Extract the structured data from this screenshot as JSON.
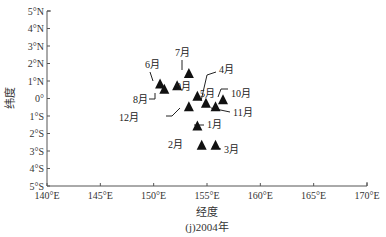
{
  "chart_data": {
    "type": "scatter",
    "title": "",
    "caption": "(j)2004年",
    "xlabel": "经度",
    "ylabel": "纬度",
    "xlim": [
      140,
      170
    ],
    "ylim": [
      -5,
      5
    ],
    "grid": false,
    "legend": "none",
    "marker": "filled-triangle",
    "x_ticks": [
      140,
      145,
      150,
      155,
      160,
      165,
      170
    ],
    "x_tick_labels": [
      "140°E",
      "145°E",
      "150°E",
      "155°E",
      "160°E",
      "165°E",
      "170°E"
    ],
    "y_ticks": [
      5,
      4,
      3,
      2,
      1,
      0,
      -1,
      -2,
      -3,
      -4,
      -5
    ],
    "y_tick_labels": [
      "5°N",
      "4°N",
      "3°N",
      "2°N",
      "1°N",
      "0°",
      "1°S",
      "2°S",
      "3°S",
      "4°S",
      "5°S"
    ],
    "points": [
      {
        "label": "1月",
        "lon": 154.1,
        "lat": -1.6,
        "lx": 207,
        "ly": 128,
        "line": [
          [
            194,
            125
          ],
          [
            204,
            125
          ]
        ],
        "anchor": "start"
      },
      {
        "label": "2月",
        "lon": 154.5,
        "lat": -2.7,
        "lx": 168,
        "ly": 148,
        "line": null,
        "anchor": "start"
      },
      {
        "label": "3月",
        "lon": 155.8,
        "lat": -2.7,
        "lx": 224,
        "ly": 153,
        "line": [
          [
            212,
            147
          ],
          [
            221,
            149
          ]
        ],
        "anchor": "start"
      },
      {
        "label": "4月",
        "lon": 154.9,
        "lat": -0.3,
        "lx": 219,
        "ly": 73,
        "line": [
          [
            201,
            101
          ],
          [
            207,
            75
          ],
          [
            216,
            72
          ]
        ],
        "anchor": "start"
      },
      {
        "label": "5月",
        "lon": 154.1,
        "lat": 0.1,
        "lx": 200,
        "ly": 97,
        "line": null,
        "anchor": "start"
      },
      {
        "label": "6月",
        "lon": 150.6,
        "lat": 0.8,
        "lx": 145,
        "ly": 68,
        "line": [
          [
            150,
            72
          ],
          [
            153,
            81
          ]
        ],
        "anchor": "start"
      },
      {
        "label": "7月",
        "lon": 153.3,
        "lat": 1.4,
        "lx": 175,
        "ly": 56,
        "line": [
          [
            182,
            60
          ],
          [
            182,
            70
          ]
        ],
        "anchor": "start"
      },
      {
        "label": "8月",
        "lon": 151.0,
        "lat": 0.5,
        "lx": 133,
        "ly": 103,
        "line": [
          [
            149,
            99
          ],
          [
            155,
            99
          ],
          [
            155,
            93
          ]
        ],
        "anchor": "start"
      },
      {
        "label": "9月",
        "lon": 152.2,
        "lat": 0.7,
        "lx": 176,
        "ly": 90,
        "line": null,
        "anchor": "start"
      },
      {
        "label": "10月",
        "lon": 156.5,
        "lat": -0.1,
        "lx": 231,
        "ly": 97,
        "line": [
          [
            218,
            97
          ],
          [
            221,
            89
          ],
          [
            228,
            89
          ]
        ],
        "anchor": "start"
      },
      {
        "label": "11月",
        "lon": 155.8,
        "lat": -0.5,
        "lx": 233,
        "ly": 116,
        "line": [
          [
            211,
            108
          ],
          [
            230,
            112
          ]
        ],
        "anchor": "start"
      },
      {
        "label": "12月",
        "lon": 153.3,
        "lat": -0.5,
        "lx": 139,
        "ly": 121,
        "line": [
          [
            166,
            116
          ],
          [
            172,
            116
          ],
          [
            180,
            108
          ]
        ],
        "anchor": "end"
      }
    ]
  }
}
